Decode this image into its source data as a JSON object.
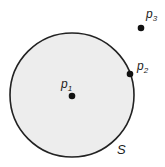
{
  "diagram": {
    "set_label": "S",
    "points": [
      {
        "name": "p",
        "sub": "1",
        "relation": "inside"
      },
      {
        "name": "p",
        "sub": "2",
        "relation": "boundary"
      },
      {
        "name": "p",
        "sub": "3",
        "relation": "outside"
      }
    ],
    "colors": {
      "fill": "#eeeeee",
      "stroke": "#222222",
      "point": "#111111"
    }
  }
}
